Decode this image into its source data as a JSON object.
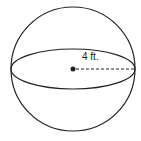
{
  "diagram": {
    "shape": "sphere",
    "radius_label": "4 ft.",
    "stroke_color": "#222222",
    "background": "#ffffff"
  }
}
